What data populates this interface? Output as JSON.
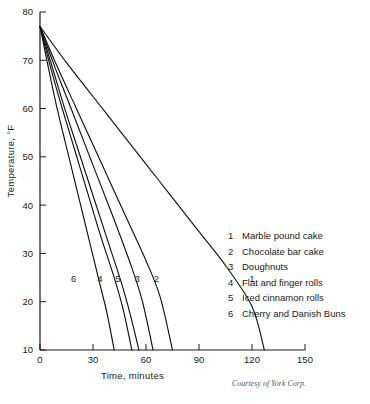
{
  "chart_data": {
    "type": "line",
    "title": "",
    "xlabel": "Time, minutes",
    "ylabel": "Temperature, °F",
    "xlim": [
      0,
      150
    ],
    "ylim": [
      10,
      80
    ],
    "xticks": [
      0,
      30,
      60,
      90,
      120,
      150
    ],
    "xticklabels": [
      "0",
      "30",
      "60",
      "90",
      "120",
      "150"
    ],
    "yticks": [
      10,
      20,
      30,
      40,
      50,
      60,
      70,
      80
    ],
    "yticklabels": [
      "10",
      "20",
      "30",
      "40",
      "50",
      "60",
      "70",
      "80"
    ],
    "grid": false,
    "legend_position": "right-center",
    "start_temperature": 77,
    "series": [
      {
        "name": "Marble pound cake",
        "key": "1",
        "label_at": {
          "x": 120,
          "y": 24
        },
        "points": [
          {
            "x": 0,
            "y": 77
          },
          {
            "x": 15,
            "y": 69.5
          },
          {
            "x": 30,
            "y": 62.5
          },
          {
            "x": 45,
            "y": 55.5
          },
          {
            "x": 60,
            "y": 48.5
          },
          {
            "x": 75,
            "y": 41.5
          },
          {
            "x": 90,
            "y": 34.5
          },
          {
            "x": 105,
            "y": 27.5
          },
          {
            "x": 120,
            "y": 19
          },
          {
            "x": 127,
            "y": 10
          }
        ]
      },
      {
        "name": "Chocolate bar cake",
        "key": "2",
        "label_at": {
          "x": 66,
          "y": 24
        },
        "points": [
          {
            "x": 0,
            "y": 77
          },
          {
            "x": 10,
            "y": 68.5
          },
          {
            "x": 20,
            "y": 60.5
          },
          {
            "x": 30,
            "y": 52.5
          },
          {
            "x": 40,
            "y": 44.5
          },
          {
            "x": 50,
            "y": 36.5
          },
          {
            "x": 60,
            "y": 28.5
          },
          {
            "x": 68,
            "y": 21
          },
          {
            "x": 75,
            "y": 10
          }
        ]
      },
      {
        "name": "Doughnuts",
        "key": "3",
        "label_at": {
          "x": 55,
          "y": 24
        },
        "points": [
          {
            "x": 0,
            "y": 77
          },
          {
            "x": 8,
            "y": 69
          },
          {
            "x": 16,
            "y": 61.5
          },
          {
            "x": 25,
            "y": 53
          },
          {
            "x": 34,
            "y": 44.5
          },
          {
            "x": 43,
            "y": 36
          },
          {
            "x": 52,
            "y": 27
          },
          {
            "x": 58,
            "y": 20
          },
          {
            "x": 64,
            "y": 10
          }
        ]
      },
      {
        "name": "Flat and finger rolls",
        "key": "4",
        "label_at": {
          "x": 34,
          "y": 24
        },
        "points": [
          {
            "x": 0,
            "y": 77
          },
          {
            "x": 6,
            "y": 68.5
          },
          {
            "x": 13,
            "y": 59.5
          },
          {
            "x": 20,
            "y": 51
          },
          {
            "x": 27,
            "y": 42.5
          },
          {
            "x": 34,
            "y": 34
          },
          {
            "x": 42,
            "y": 25
          },
          {
            "x": 47,
            "y": 18.5
          },
          {
            "x": 52,
            "y": 10
          }
        ]
      },
      {
        "name": "Iced cinnamon rolls",
        "key": "5",
        "label_at": {
          "x": 44,
          "y": 24
        },
        "points": [
          {
            "x": 0,
            "y": 77
          },
          {
            "x": 7,
            "y": 68.5
          },
          {
            "x": 14,
            "y": 60
          },
          {
            "x": 22,
            "y": 51
          },
          {
            "x": 30,
            "y": 42
          },
          {
            "x": 38,
            "y": 33
          },
          {
            "x": 46,
            "y": 24
          },
          {
            "x": 51,
            "y": 17.5
          },
          {
            "x": 56,
            "y": 10
          }
        ]
      },
      {
        "name": "Cherry and Danish Buns",
        "key": "6",
        "label_at": {
          "x": 19,
          "y": 24
        },
        "points": [
          {
            "x": 0,
            "y": 77
          },
          {
            "x": 5,
            "y": 68
          },
          {
            "x": 10,
            "y": 59.5
          },
          {
            "x": 16,
            "y": 50.5
          },
          {
            "x": 22,
            "y": 41.5
          },
          {
            "x": 28,
            "y": 32.5
          },
          {
            "x": 34,
            "y": 23.5
          },
          {
            "x": 38,
            "y": 17.5
          },
          {
            "x": 42,
            "y": 10
          }
        ]
      }
    ]
  },
  "legend": {
    "items": [
      {
        "key": "1",
        "label": "Marble pound cake"
      },
      {
        "key": "2",
        "label": "Chocolate bar cake"
      },
      {
        "key": "3",
        "label": "Doughnuts"
      },
      {
        "key": "4",
        "label": "Flat and finger rolls"
      },
      {
        "key": "5",
        "label": "Iced cinnamon rolls"
      },
      {
        "key": "6",
        "label": "Cherry and Danish Buns"
      }
    ]
  },
  "credit": "Courtesy of York Corp."
}
